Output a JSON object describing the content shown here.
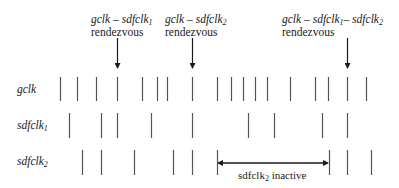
{
  "annotations": [
    {
      "id": "r1",
      "line1_a": "gclk",
      "line1_sep": " – ",
      "line1_b": "sdfclk",
      "line1_b_sub": "1",
      "line2": "rendezvous",
      "x": 117
    },
    {
      "id": "r2",
      "line1_a": "gclk",
      "line1_sep": " – ",
      "line1_b": "sdfclk",
      "line1_b_sub": "2",
      "line2": "rendezvous",
      "x": 192
    },
    {
      "id": "r3",
      "line1_a": "gclk",
      "line1_sep": " – ",
      "line1_b": "sdfclk",
      "line1_b_sub": "1",
      "line1_sep2": "– ",
      "line1_c": "sdfclk",
      "line1_c_sub": "2",
      "line2": "rendezvous",
      "x": 347
    }
  ],
  "rows": [
    {
      "name": "gclk",
      "sub": "",
      "y_top": 77,
      "y_bot": 101,
      "ticks": [
        60,
        77,
        96,
        117,
        142,
        157,
        167,
        192,
        217,
        231,
        243,
        255,
        267,
        290,
        315,
        328,
        347,
        366
      ]
    },
    {
      "name": "sdfclk",
      "sub": "1",
      "y_top": 113,
      "y_bot": 138,
      "ticks": [
        69,
        101,
        117,
        151,
        192,
        248,
        274,
        322,
        347
      ]
    },
    {
      "name": "sdfclk",
      "sub": "2",
      "y_top": 150,
      "y_bot": 175,
      "ticks": [
        82,
        101,
        134,
        173,
        192,
        217,
        329,
        347,
        371
      ]
    }
  ],
  "inactive": {
    "label": "sdfclk",
    "label_sub": "2",
    "label_rest": " inactive",
    "x_start": 217,
    "x_end": 329,
    "y": 163
  },
  "colors": {
    "line": "#555555",
    "text": "#1a1a1a"
  }
}
